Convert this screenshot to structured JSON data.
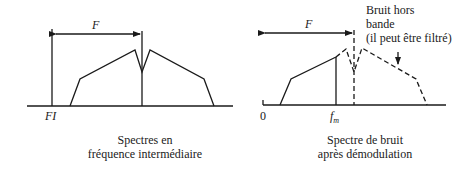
{
  "left_panel": {
    "bandwidth_label": "F",
    "origin_label": "FI",
    "caption_line1": "Spectres en",
    "caption_line2": "fréquence intermédiaire"
  },
  "right_panel": {
    "bandwidth_label": "F",
    "origin_label": "0",
    "fm_label": "f",
    "fm_subscript": "m",
    "annotation_line1": "Bruit hors",
    "annotation_line2": "bande",
    "annotation_line3": "(il peut être filtré)",
    "caption_line1": "Spectre de bruit",
    "caption_line2": "après démodulation"
  },
  "colors": {
    "ink": "#1a1a1a",
    "background": "#ffffff"
  }
}
